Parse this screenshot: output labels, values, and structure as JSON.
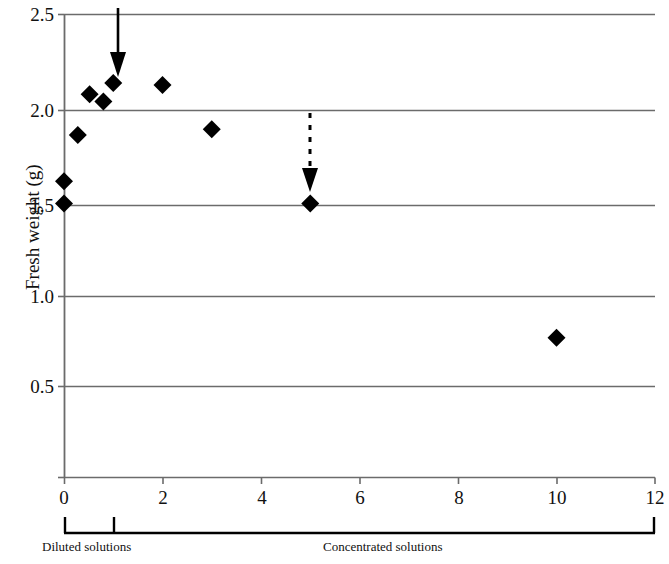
{
  "chart_data": {
    "type": "scatter",
    "title": "",
    "xlabel": "",
    "ylabel": "Fresh weight (g)",
    "xlim": [
      0,
      12
    ],
    "ylim": [
      0,
      2.5
    ],
    "grid": true,
    "grid_axis": "y",
    "legend": "none",
    "marker": "filled-diamond",
    "marker_color": "#000000",
    "x_ticks": [
      0,
      2,
      4,
      6,
      8,
      10,
      12
    ],
    "x_tick_labels": [
      "0",
      "2",
      "4",
      "6",
      "8",
      "10",
      "12"
    ],
    "y_ticks": [
      0.5,
      1.0,
      1.5,
      2.0,
      2.5
    ],
    "y_tick_labels": [
      "0.5",
      "1.0",
      "1.5",
      "2.0",
      "2.5"
    ],
    "x": [
      0.0,
      0.0,
      0.28,
      0.52,
      0.8,
      1.0,
      2.0,
      3.0,
      5.0,
      10.0
    ],
    "y": [
      1.48,
      1.6,
      1.85,
      2.07,
      2.03,
      2.13,
      2.12,
      1.88,
      1.48,
      0.755
    ],
    "points": [
      {
        "x": 0.0,
        "y": 1.48
      },
      {
        "x": 0.0,
        "y": 1.6
      },
      {
        "x": 0.28,
        "y": 1.85
      },
      {
        "x": 0.52,
        "y": 2.07
      },
      {
        "x": 0.8,
        "y": 2.03
      },
      {
        "x": 1.0,
        "y": 2.13
      },
      {
        "x": 2.0,
        "y": 2.12
      },
      {
        "x": 3.0,
        "y": 1.88
      },
      {
        "x": 5.0,
        "y": 1.48
      },
      {
        "x": 10.0,
        "y": 0.755
      }
    ],
    "annotations": [
      {
        "name": "solid-arrow",
        "style": "solid",
        "x": 1.09,
        "y_start": 2.5,
        "y_end": 2.22,
        "direction": "down"
      },
      {
        "name": "dashed-arrow",
        "style": "dashed",
        "x": 5.0,
        "y_start": 2.0,
        "y_end": 1.63,
        "direction": "down"
      }
    ],
    "axis_brackets": [
      {
        "label": "Diluted solutions",
        "x_start": 0,
        "x_end": 1
      },
      {
        "label": "Concentrated solutions",
        "x_start": 1,
        "x_end": 12
      }
    ]
  },
  "axis": {
    "y_title": "Fresh weight (g)"
  },
  "brackets": {
    "diluted_label": "Diluted solutions",
    "concentrated_label": "Concentrated solutions"
  },
  "ticks": {
    "y": {
      "t25": "2.5",
      "t20": "2.0",
      "t15": "1.5",
      "t10": "1.0",
      "t05": "0.5"
    },
    "x": {
      "t0": "0",
      "t2": "2",
      "t4": "4",
      "t6": "6",
      "t8": "8",
      "t10": "10",
      "t12": "12"
    }
  },
  "colors": {
    "marker": "#000000",
    "grid": "#6b6b6b",
    "axis": "#6b6b6b",
    "text": "#111111"
  }
}
